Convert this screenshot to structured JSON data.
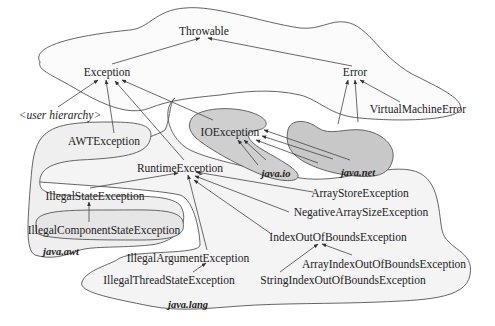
{
  "diagram": {
    "type": "class-hierarchy",
    "nodes": {
      "throwable": "Throwable",
      "exception": "Exception",
      "error": "Error",
      "virtual_machine_error": "VirtualMachineError",
      "user_hierarchy": "<user hierarchy>",
      "awt_exception": "AWTException",
      "io_exception": "IOException",
      "runtime_exception": "RuntimeException",
      "illegal_state_exception": "IllegalStateException",
      "illegal_component_state_exception": "IllegalComponentStateException",
      "array_store_exception": "ArrayStoreException",
      "negative_array_size_exception": "NegativeArraySizeException",
      "index_out_of_bounds_exception": "IndexOutOfBoundsException",
      "illegal_argument_exception": "IllegalArgumentException",
      "illegal_thread_state_exception": "IllegalThreadStateException",
      "array_index_out_of_bounds_exception": "ArrayIndexOutOfBoundsException",
      "string_index_out_of_bounds_exception": "StringIndexOutOfBoundsException"
    },
    "packages": {
      "java_io": "java.io",
      "java_net": "java.net",
      "java_awt": "java.awt",
      "java_lang": "java.lang"
    },
    "edges": [
      {
        "from": "Exception",
        "to": "Throwable"
      },
      {
        "from": "Error",
        "to": "Throwable"
      },
      {
        "from": "VirtualMachineError",
        "to": "Error"
      },
      {
        "from": "<user hierarchy>",
        "to": "Exception"
      },
      {
        "from": "AWTException",
        "to": "Exception"
      },
      {
        "from": "RuntimeException",
        "to": "Exception"
      },
      {
        "from": "IOException",
        "to": "Exception"
      },
      {
        "from": "IllegalStateException",
        "to": "RuntimeException"
      },
      {
        "from": "IllegalComponentStateException",
        "to": "IllegalStateException"
      },
      {
        "from": "IllegalArgumentException",
        "to": "RuntimeException"
      },
      {
        "from": "IllegalThreadStateException",
        "to": "IllegalArgumentException"
      },
      {
        "from": "ArrayStoreException",
        "to": "RuntimeException"
      },
      {
        "from": "NegativeArraySizeException",
        "to": "RuntimeException"
      },
      {
        "from": "IndexOutOfBoundsException",
        "to": "RuntimeException"
      },
      {
        "from": "ArrayIndexOutOfBoundsException",
        "to": "IndexOutOfBoundsException"
      },
      {
        "from": "StringIndexOutOfBoundsException",
        "to": "IndexOutOfBoundsException"
      },
      {
        "from": "java.io (subclasses)",
        "to": "IOException"
      },
      {
        "from": "java.net (subclasses)",
        "to": "IOException"
      },
      {
        "from": "java.net (subclasses)",
        "to": "Error"
      }
    ],
    "colors": {
      "line": "#444444",
      "light_fill": "#f4f4f4",
      "dark_fill": "#cfcfcf",
      "text": "#222222"
    }
  }
}
